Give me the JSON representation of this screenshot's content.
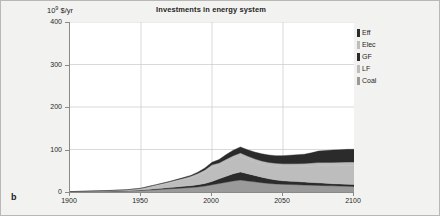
{
  "figure": {
    "panel_letter": "b",
    "background_color": "#f2f2f0",
    "border_color": "#b8b8b4"
  },
  "chart_data": {
    "type": "area",
    "stacked": true,
    "title": "Investments in energy system",
    "xlabel": "",
    "ylabel": "10⁹ $/yr",
    "ylabel_mantissa": "10",
    "ylabel_exponent": "9",
    "ylabel_unit": " $/yr",
    "xlim": [
      1900,
      2100
    ],
    "ylim": [
      0,
      400
    ],
    "grid": true,
    "grid_color": "#c9c9c9",
    "plot_background": "#ffffff",
    "legend_position": "right",
    "xticks": [
      1900,
      1950,
      2000,
      2050,
      2100
    ],
    "xtick_labels": [
      "1900",
      "1950",
      "2000",
      "2050",
      "2100"
    ],
    "yticks": [
      0,
      100,
      200,
      300,
      400
    ],
    "ytick_labels": [
      "0",
      "100",
      "200",
      "300",
      "400"
    ],
    "x": [
      1900,
      1910,
      1920,
      1930,
      1940,
      1950,
      1955,
      1960,
      1965,
      1970,
      1975,
      1980,
      1985,
      1990,
      1995,
      2000,
      2005,
      2010,
      2015,
      2020,
      2025,
      2030,
      2035,
      2040,
      2045,
      2050,
      2055,
      2060,
      2065,
      2070,
      2075,
      2080,
      2085,
      2090,
      2095,
      2100
    ],
    "series": [
      {
        "name": "Coal",
        "label": "Coal",
        "color": "#9a9a9a",
        "order": 1,
        "values": [
          0.5,
          0.8,
          1.2,
          1.6,
          2.2,
          3.5,
          4.5,
          5.5,
          6.5,
          7.5,
          8.5,
          9.5,
          10.5,
          12.0,
          14.0,
          17.0,
          20.0,
          23.0,
          26.0,
          28.0,
          26.0,
          24.0,
          22.0,
          20.0,
          19.0,
          18.0,
          17.5,
          17.0,
          16.5,
          16.0,
          15.5,
          15.0,
          14.5,
          14.0,
          13.5,
          13.0
        ]
      },
      {
        "name": "LF",
        "label": "LF",
        "color": "#2b2b2b",
        "order": 2,
        "values": [
          0.2,
          0.3,
          0.5,
          0.7,
          0.9,
          1.2,
          1.6,
          2.0,
          2.4,
          2.8,
          3.4,
          4.0,
          4.5,
          5.2,
          6.0,
          8.0,
          11.0,
          14.0,
          17.0,
          19.0,
          17.0,
          15.0,
          13.0,
          11.0,
          9.5,
          8.5,
          8.0,
          7.5,
          7.0,
          6.5,
          6.0,
          5.5,
          5.2,
          5.0,
          4.8,
          4.5
        ]
      },
      {
        "name": "GF",
        "label": "GF",
        "color": "#bdbdbd",
        "order": 3,
        "values": [
          0.2,
          0.4,
          0.7,
          1.0,
          1.5,
          3.0,
          5.0,
          7.0,
          9.0,
          11.0,
          13.5,
          15.5,
          18.0,
          22.0,
          27.0,
          33.0,
          31.0,
          33.0,
          35.0,
          37.0,
          34.0,
          32.0,
          31.0,
          31.5,
          32.0,
          33.0,
          34.0,
          35.0,
          36.0,
          38.0,
          40.0,
          41.0,
          42.0,
          43.0,
          44.0,
          45.0
        ]
      },
      {
        "name": "Elec",
        "label": "Elec",
        "color": "#bdbdbd",
        "order": 4,
        "values": [
          0.1,
          0.2,
          0.3,
          0.5,
          0.7,
          1.0,
          1.4,
          1.8,
          2.2,
          2.6,
          3.0,
          3.5,
          4.0,
          4.5,
          5.0,
          6.0,
          6.5,
          7.0,
          7.5,
          8.0,
          7.5,
          7.0,
          7.0,
          7.0,
          7.0,
          7.0,
          7.0,
          7.2,
          7.4,
          7.6,
          7.8,
          8.0,
          8.0,
          8.0,
          8.0,
          8.0
        ]
      },
      {
        "name": "Eff",
        "label": "Eff",
        "color": "#2b2b2b",
        "order": 5,
        "values": [
          0.0,
          0.0,
          0.0,
          0.0,
          0.0,
          0.2,
          0.3,
          0.4,
          0.6,
          0.8,
          1.0,
          1.5,
          2.0,
          3.0,
          4.5,
          6.0,
          8.0,
          11.0,
          13.0,
          14.0,
          15.0,
          16.0,
          17.0,
          17.5,
          18.0,
          19.0,
          20.0,
          21.0,
          22.0,
          24.0,
          27.0,
          28.0,
          29.0,
          29.5,
          30.0,
          30.0
        ]
      }
    ],
    "legend_entries": [
      {
        "label": "Eff",
        "color": "#2b2b2b"
      },
      {
        "label": "Elec",
        "color": "#bdbdbd"
      },
      {
        "label": "GF",
        "color": "#2b2b2b"
      },
      {
        "label": "LF",
        "color": "#bdbdbd"
      },
      {
        "label": "Coal",
        "color": "#9a9a9a"
      }
    ]
  }
}
